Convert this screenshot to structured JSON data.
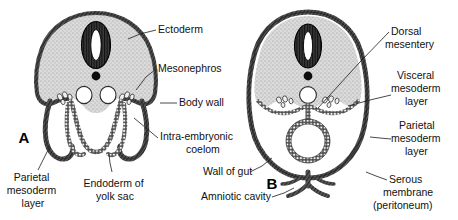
{
  "figure": {
    "background_color": "#ffffff",
    "ink_color": "#1a1a1a",
    "tissue_fill": "#d8d8d8",
    "membrane_color": "#4a4a4a"
  },
  "panels": [
    {
      "id": "A",
      "label": "A",
      "x": 24,
      "y": 139,
      "description": "Earlier stage: open gut, lateral body folds not yet fused"
    },
    {
      "id": "B",
      "label": "B",
      "x": 272,
      "y": 185,
      "description": "Later stage: body wall fused, gut closed and suspended by mesentery"
    }
  ],
  "labels": [
    {
      "name": "ectoderm",
      "lines": [
        "Ectoderm"
      ],
      "x": 158,
      "y": 30,
      "anchor": "start",
      "leader": [
        [
          156,
          30
        ],
        [
          140,
          34
        ],
        [
          128,
          39
        ]
      ]
    },
    {
      "name": "mesonephros",
      "lines": [
        "Mesonephros"
      ],
      "x": 158,
      "y": 69,
      "anchor": "start",
      "leader": [
        [
          156,
          69
        ],
        [
          146,
          77
        ],
        [
          136,
          90
        ]
      ]
    },
    {
      "name": "body-wall",
      "lines": [
        "Body wall"
      ],
      "x": 179,
      "y": 103,
      "anchor": "start",
      "leader": [
        [
          177,
          103
        ],
        [
          168,
          103
        ],
        [
          160,
          103
        ]
      ]
    },
    {
      "name": "intra-embryonic-coelom",
      "lines": [
        "Intra-embryonic",
        "coelom"
      ],
      "x": 160,
      "y": 143,
      "anchor": "start",
      "leader": [
        [
          158,
          138
        ],
        [
          146,
          128
        ],
        [
          134,
          118
        ]
      ]
    },
    {
      "name": "wall-of-gut",
      "lines": [
        "Wall of gut"
      ],
      "x": 203,
      "y": 172,
      "anchor": "start",
      "leader": [
        [
          250,
          172
        ],
        [
          262,
          166
        ],
        [
          272,
          158
        ]
      ]
    },
    {
      "name": "amniotic-cavity",
      "lines": [
        "Amniotic cavity"
      ],
      "x": 201,
      "y": 197,
      "anchor": "start",
      "leader": [
        [
          272,
          197
        ],
        [
          284,
          193
        ],
        [
          294,
          188
        ]
      ]
    },
    {
      "name": "parietal-mesoderm-layer-left",
      "lines": [
        "Parietal",
        "mesoderm",
        "layer"
      ],
      "x": 33,
      "y": 183,
      "anchor": "middle",
      "leader": [
        [
          38,
          170
        ],
        [
          44,
          158
        ],
        [
          50,
          146
        ]
      ]
    },
    {
      "name": "endoderm-of-yolk-sac",
      "lines": [
        "Endoderm of",
        "yolk sac"
      ],
      "x": 115,
      "y": 183,
      "anchor": "middle",
      "leader": [
        [
          112,
          172
        ],
        [
          110,
          163
        ],
        [
          109,
          154
        ]
      ]
    },
    {
      "name": "dorsal-mesentery",
      "lines": [
        "Dorsal",
        "mesentery"
      ],
      "x": 391,
      "y": 38,
      "anchor": "start",
      "leader": [
        [
          389,
          32
        ],
        [
          360,
          62
        ],
        [
          318,
          108
        ]
      ]
    },
    {
      "name": "visceral-mesoderm-layer",
      "lines": [
        "Visceral",
        "mesoderm",
        "layer"
      ],
      "x": 393,
      "y": 85,
      "anchor": "start",
      "leader": [
        [
          391,
          95
        ],
        [
          370,
          100
        ],
        [
          348,
          106
        ]
      ]
    },
    {
      "name": "parietal-mesoderm-layer-right",
      "lines": [
        "Parietal",
        "mesoderm",
        "layer"
      ],
      "x": 393,
      "y": 139,
      "anchor": "start",
      "leader": [
        [
          391,
          139
        ],
        [
          380,
          138
        ],
        [
          370,
          137
        ]
      ]
    },
    {
      "name": "serous-membrane-peritoneum",
      "lines": [
        "Serous",
        "membrane",
        "(peritoneum)"
      ],
      "x": 389,
      "y": 188,
      "anchor": "start",
      "leader": [
        [
          387,
          180
        ],
        [
          376,
          176
        ],
        [
          366,
          172
        ]
      ]
    }
  ],
  "structures": {
    "neural_tube": "neural tube with slit-like lumen",
    "notochord": "notochord (solid dot)",
    "gut": "gut tube",
    "coelom": "intra-embryonic coelom",
    "mesonephros": "mesonephric tissue clusters"
  }
}
